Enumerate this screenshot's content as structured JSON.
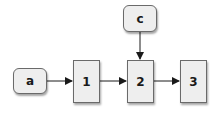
{
  "diagram": {
    "nodes": [
      {
        "id": "a",
        "label": "a",
        "shape": "rounded",
        "x": 13,
        "y": 68,
        "w": 34,
        "h": 26
      },
      {
        "id": "1",
        "label": "1",
        "shape": "rect",
        "x": 73,
        "y": 60,
        "w": 27,
        "h": 43
      },
      {
        "id": "2",
        "label": "2",
        "shape": "rect",
        "x": 127,
        "y": 60,
        "w": 27,
        "h": 43
      },
      {
        "id": "3",
        "label": "3",
        "shape": "rect",
        "x": 180,
        "y": 60,
        "w": 27,
        "h": 43
      },
      {
        "id": "c",
        "label": "c",
        "shape": "rounded",
        "x": 123,
        "y": 5,
        "w": 34,
        "h": 27
      }
    ],
    "edges": [
      {
        "from": "a",
        "to": "1"
      },
      {
        "from": "1",
        "to": "2"
      },
      {
        "from": "2",
        "to": "3"
      },
      {
        "from": "c",
        "to": "2"
      }
    ],
    "colors": {
      "node_fill": "#eeeeee",
      "node_border": "#6a6a6a",
      "arrow": "#1a1a1a"
    }
  }
}
